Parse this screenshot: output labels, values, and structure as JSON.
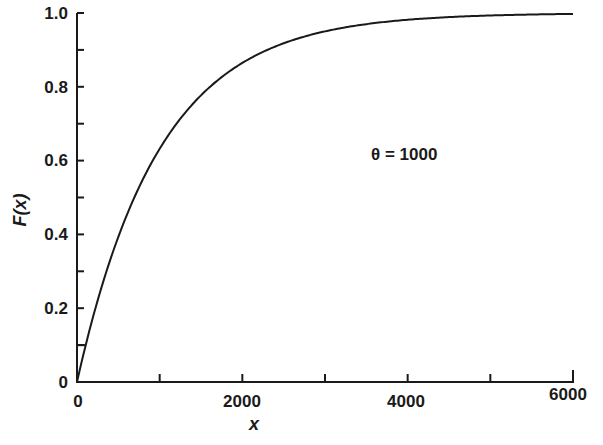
{
  "chart_data": {
    "type": "line",
    "title": "",
    "xlabel": "x",
    "ylabel": "F(x)",
    "xlim": [
      0,
      6000
    ],
    "ylim": [
      0,
      1.0
    ],
    "grid": false,
    "legend": null,
    "x_ticks": [
      0,
      1000,
      2000,
      3000,
      4000,
      5000,
      6000
    ],
    "x_tick_labels": [
      "0",
      "",
      "2000",
      "",
      "4000",
      "",
      "6000"
    ],
    "y_ticks": [
      0,
      0.1,
      0.2,
      0.3,
      0.4,
      0.5,
      0.6,
      0.7,
      0.8,
      0.9,
      1.0
    ],
    "y_tick_labels": [
      "0",
      "",
      "0.2",
      "",
      "0.4",
      "",
      "0.6",
      "",
      "0.8",
      "",
      "1.0"
    ],
    "annotations": [
      {
        "text": "θ = 1000",
        "x": 3800,
        "y": 0.62
      }
    ],
    "series": [
      {
        "name": "F(x) = 1 - exp(-x/θ), θ = 1000",
        "x": [
          0,
          250,
          500,
          750,
          1000,
          1250,
          1500,
          1750,
          2000,
          2500,
          3000,
          3500,
          4000,
          4500,
          5000,
          5500,
          6000
        ],
        "values": [
          0.0,
          0.221,
          0.393,
          0.528,
          0.632,
          0.713,
          0.777,
          0.826,
          0.865,
          0.918,
          0.95,
          0.97,
          0.982,
          0.989,
          0.993,
          0.996,
          0.998
        ]
      }
    ],
    "marker_segment": {
      "y": 0.1,
      "x_from": 0,
      "x_to": 105
    }
  },
  "labels": {
    "x_axis_title": "x",
    "y_axis_title": "F(x)",
    "annotation": "θ = 1000",
    "x_ticks": {
      "t0": "0",
      "t2000": "2000",
      "t4000": "4000",
      "t6000": "6000"
    },
    "y_ticks": {
      "t0": "0",
      "t02": "0.2",
      "t04": "0.4",
      "t06": "0.6",
      "t08": "0.8",
      "t10": "1.0"
    }
  }
}
